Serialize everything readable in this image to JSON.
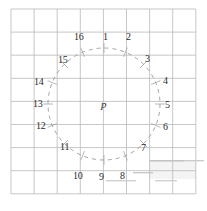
{
  "figure": {
    "canvas": {
      "width": 207,
      "height": 211,
      "background": "#ffffff"
    },
    "grid": {
      "name": "square-grid",
      "origin_x": 11,
      "origin_y": 9,
      "cell": 23.1,
      "cols": 8,
      "rows": 8,
      "line_color": "#b9b9b9",
      "line_width": 0.8
    },
    "circle": {
      "name": "dashed-circle",
      "center_x": 104,
      "center_y": 104,
      "radius": 56,
      "stroke": "#9a9a9a",
      "stroke_width": 0.9,
      "dash": "4 4"
    },
    "center_label": {
      "text": "p",
      "x": 101,
      "y": 99
    },
    "points": [
      {
        "id": 1,
        "label": "1",
        "angle_deg": 0,
        "lx": 103,
        "ly": 32
      },
      {
        "id": 2,
        "label": "2",
        "angle_deg": 22.5,
        "lx": 126,
        "ly": 32
      },
      {
        "id": 3,
        "label": "3",
        "angle_deg": 45,
        "lx": 145,
        "ly": 54
      },
      {
        "id": 4,
        "label": "4",
        "angle_deg": 67.5,
        "lx": 163,
        "ly": 76
      },
      {
        "id": 5,
        "label": "5",
        "angle_deg": 90,
        "lx": 165,
        "ly": 100
      },
      {
        "id": 6,
        "label": "6",
        "angle_deg": 112.5,
        "lx": 163,
        "ly": 122
      },
      {
        "id": 7,
        "label": "7",
        "angle_deg": 135,
        "lx": 141,
        "ly": 143
      },
      {
        "id": 8,
        "label": "8",
        "angle_deg": 157.5,
        "lx": 120,
        "ly": 171
      },
      {
        "id": 9,
        "label": "9",
        "angle_deg": 180,
        "lx": 99,
        "ly": 172
      },
      {
        "id": 10,
        "label": "10",
        "angle_deg": 202.5,
        "lx": 73,
        "ly": 171
      },
      {
        "id": 11,
        "label": "11",
        "angle_deg": 225,
        "lx": 60,
        "ly": 142
      },
      {
        "id": 12,
        "label": "12",
        "angle_deg": 247.5,
        "lx": 36,
        "ly": 121
      },
      {
        "id": 13,
        "label": "13",
        "angle_deg": 270,
        "lx": 33,
        "ly": 99
      },
      {
        "id": 14,
        "label": "14",
        "angle_deg": 292.5,
        "lx": 34,
        "ly": 77
      },
      {
        "id": 15,
        "label": "15",
        "angle_deg": 315,
        "lx": 58,
        "ly": 55
      },
      {
        "id": 16,
        "label": "16",
        "angle_deg": 337.5,
        "lx": 74,
        "ly": 32
      }
    ],
    "artifacts": [
      {
        "name": "scan-streak-1",
        "x": 150,
        "y": 160,
        "w": 34,
        "h": 1.6,
        "color": "#c4c4c4"
      },
      {
        "name": "scan-streak-2",
        "x": 184,
        "y": 160,
        "w": 20,
        "h": 1.4,
        "color": "#cccccc"
      },
      {
        "name": "scan-streak-3",
        "x": 133,
        "y": 172,
        "w": 20,
        "h": 1.4,
        "color": "#c9c9c9"
      },
      {
        "name": "scan-streak-4",
        "x": 106,
        "y": 180,
        "w": 30,
        "h": 1.4,
        "color": "#cfcfcf"
      },
      {
        "name": "scan-streak-5",
        "x": 155,
        "y": 180,
        "w": 22,
        "h": 1.4,
        "color": "#cfcfcf"
      },
      {
        "name": "scan-shade-block",
        "x": 149,
        "y": 161,
        "w": 47,
        "h": 18,
        "color": "#f0f0f0"
      }
    ]
  }
}
